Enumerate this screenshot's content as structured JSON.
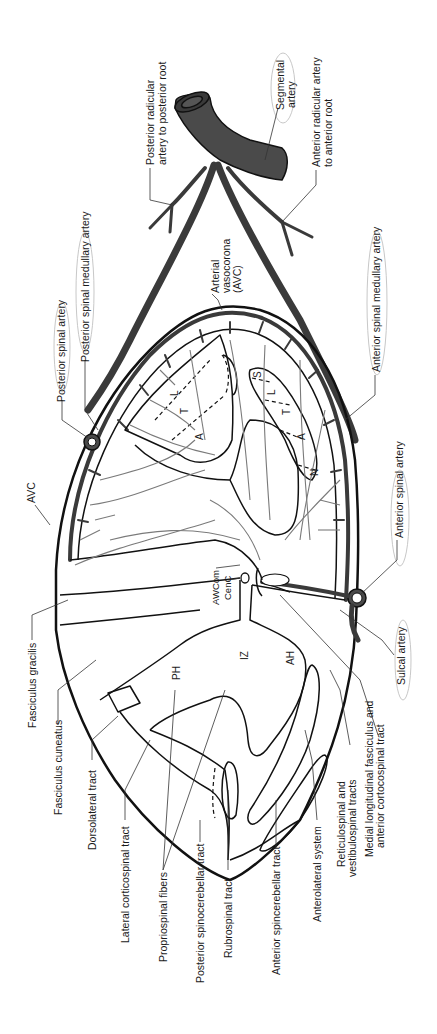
{
  "figure": {
    "orientation": "rotated 90° counter-clockwise",
    "colors": {
      "artery_fill": "#4a4a4a",
      "artery_stroke": "#111111",
      "capillary": "#7a7a7a",
      "outline": "#111111",
      "highlight_oval": "#c8c8c8",
      "background": "#ffffff"
    }
  },
  "labels": {
    "segmental_artery": "Segmental artery",
    "posterior_radicular_1": "Posterior radicular",
    "posterior_radicular_2": "artery to posterior root",
    "anterior_radicular_1": "Anterior radicular artery",
    "anterior_radicular_2": "to anterior root",
    "arterial_vasocorona_1": "Arterial",
    "arterial_vasocorona_2": "vasocorona",
    "arterial_vasocorona_3": "(AVC)",
    "posterior_spinal_medullary_artery": "Posterior spinal medullary artery",
    "posterior_spinal_artery": "Posterior spinal artery",
    "anterior_spinal_medullary_artery": "Anterior spinal medullary artery",
    "anterior_spinal_artery": "Anterior spinal artery",
    "avc": "AVC",
    "sulcal_artery": "Sulcal artery",
    "awcom": "AWCom",
    "cenc": "CenC",
    "fasciculus_gracilis": "Fasciculus gracilis",
    "fasciculus_cuneatus": "Fasciculus cuneatus",
    "dorsolateral_tract": "Dorsolateral tract",
    "lateral_corticospinal_tract": "Lateral corticospinal tract",
    "propriospinal_fibers": "Propriospinal fibers",
    "posterior_spinocerebellar_tract": "Posterior spinocerebellar tract",
    "rubrospinal_tract": "Rubrospinal tract",
    "anterior_spinocerebellar_tract": "Anterior spincerebellar tract",
    "anterolateral_system": "Anterolateral system",
    "reticulospinal_1": "Reticulospinal and",
    "reticulospinal_2": "vestibulospinal tracts",
    "medial_longitudinal_1": "Medial longitudinal fasciculus and",
    "medial_longitudinal_2": "anterior cortocospinal tract"
  },
  "regions": {
    "ph": "PH",
    "iz": "IZ",
    "ah": "AH",
    "lcst_segments": [
      "L",
      "T",
      "A"
    ],
    "alst_segments": [
      "S",
      "L",
      "T",
      "A",
      "N"
    ]
  }
}
